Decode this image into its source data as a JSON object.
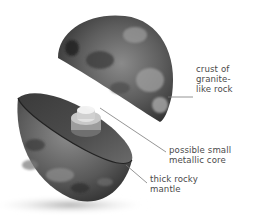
{
  "diagram": {
    "colors": {
      "background": "#ffffff",
      "rock_dark": "#2e2e2e",
      "rock_mid": "#6b6b6b",
      "rock_light": "#a8a8a8",
      "core": "#b8b8b8",
      "leader_line": "#7a7a7a",
      "label_text": "#4a4a4a"
    },
    "labels": [
      {
        "id": "crust",
        "lines": [
          "crust of",
          "granite-",
          "like rock"
        ]
      },
      {
        "id": "core",
        "lines": [
          "possible small",
          "metallic core"
        ]
      },
      {
        "id": "mantle",
        "lines": [
          "thick rocky",
          "mantle"
        ]
      }
    ]
  }
}
